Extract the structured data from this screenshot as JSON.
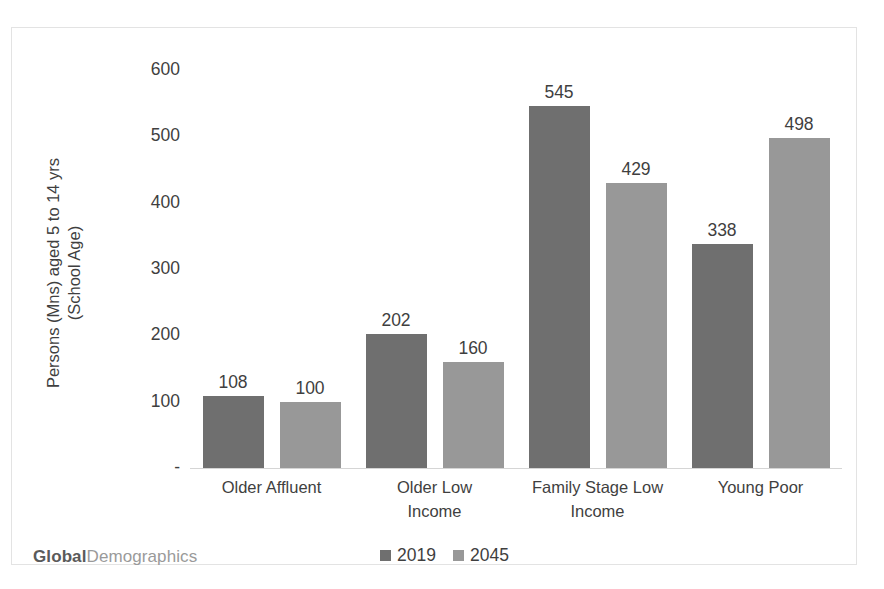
{
  "chart_data": {
    "type": "bar",
    "title": "",
    "subtitle": "",
    "xlabel": "",
    "ylabel": "Persons (Mns) aged 5 to 14 yrs (School Age)",
    "ylabel_lines": [
      "Persons (Mns) aged 5 to 14 yrs",
      "(School Age)"
    ],
    "categories": [
      "Older Affluent",
      "Older Low Income",
      "Family Stage Low Income",
      "Young Poor"
    ],
    "category_lines": [
      [
        "Older Affluent"
      ],
      [
        "Older Low",
        "Income"
      ],
      [
        "Family Stage Low",
        "Income"
      ],
      [
        "Young Poor"
      ]
    ],
    "series": [
      {
        "name": "2019",
        "color": "#6f6f6f",
        "values": [
          108,
          202,
          545,
          338
        ]
      },
      {
        "name": "2045",
        "color": "#989898",
        "values": [
          100,
          160,
          429,
          498
        ]
      }
    ],
    "ylim": [
      0,
      600
    ],
    "yticks": [
      600,
      500,
      400,
      300,
      200,
      100,
      0
    ],
    "ytick_labels": [
      "600",
      "500",
      "400",
      "300",
      "200",
      "100",
      "-"
    ],
    "grid": false,
    "legend_position": "bottom-center",
    "data_labels": true
  },
  "footer": {
    "logo_bold": "Global",
    "logo_light": "Demographics"
  },
  "colors": {
    "series_2019": "#6f6f6f",
    "series_2045": "#989898",
    "text": "#3f3f3f",
    "frame_border": "#e3e3e3",
    "axis_line": "#d5d5d5",
    "background": "#ffffff"
  }
}
